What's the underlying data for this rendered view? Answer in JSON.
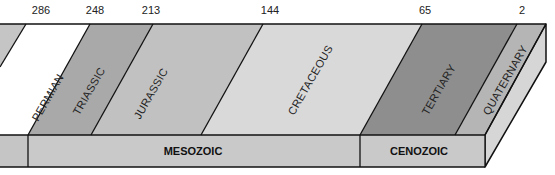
{
  "diagram": {
    "type": "geologic-time-scale",
    "ages_ma": [
      {
        "label": "286",
        "x": 41
      },
      {
        "label": "248",
        "x": 95
      },
      {
        "label": "213",
        "x": 151
      },
      {
        "label": "144",
        "x": 270
      },
      {
        "label": "65",
        "x": 425
      },
      {
        "label": "2",
        "x": 522
      }
    ],
    "periods": [
      {
        "name": "PERMIAN",
        "color": "#ffffff"
      },
      {
        "name": "TRIASSIC",
        "color": "#a9a9a9"
      },
      {
        "name": "JURASSIC",
        "color": "#c1c1c1"
      },
      {
        "name": "CRETACEOUS",
        "color": "#d9d9d9"
      },
      {
        "name": "TERTIARY",
        "color": "#8e8e8e"
      },
      {
        "name": "QUATERNARY",
        "color": "#b5b5b5"
      }
    ],
    "eras": [
      {
        "name": "MESOZOIC"
      },
      {
        "name": "CENOZOIC"
      }
    ],
    "colors": {
      "paleozoic_fill": "#c5c5c5",
      "era_band": "#c9c9c9",
      "side_face": "#d6d6d6",
      "outline": "#111111"
    }
  }
}
